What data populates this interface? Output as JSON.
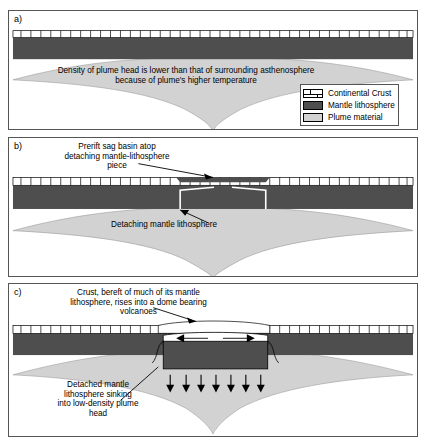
{
  "figure": {
    "type": "geologic-cross-section-diagram",
    "panels": [
      {
        "id": "a",
        "label": "a)",
        "annotations": [
          {
            "name": "plume-density-note",
            "text": "Density of plume head is lower than that of surrounding asthenosphere\nbecause of plume's higher temperature"
          }
        ]
      },
      {
        "id": "b",
        "label": "b)",
        "annotations": [
          {
            "name": "prerift-sag-basin-note",
            "text": "Prerift sag basin atop\ndetaching mantle-lithosphere\npiece"
          },
          {
            "name": "detaching-mantle-lithosphere-note",
            "text": "Detaching mantle lithosphere"
          }
        ]
      },
      {
        "id": "c",
        "label": "c)",
        "annotations": [
          {
            "name": "crust-dome-note",
            "text": "Crust, bereft of much of its mantle\nlithosphere, rises into a dome bearing\nvolcanoes"
          },
          {
            "name": "detached-sinking-note",
            "text": "Detached mantle\nlithosphere sinking\ninto low-density plume\nhead"
          }
        ]
      }
    ]
  },
  "legend": {
    "items": [
      {
        "label": "Continental Crust",
        "swatch": "crust",
        "color": "#ffffff"
      },
      {
        "label": "Mantle lithosphere",
        "swatch": "mantle",
        "color": "#4e4e4e"
      },
      {
        "label": "Plume material",
        "swatch": "plume",
        "color": "#d2d2d2"
      }
    ]
  },
  "colors": {
    "crust": "#ffffff",
    "mantle_lithosphere": "#4e4e4e",
    "plume_material": "#d2d2d2",
    "outline": "#555555",
    "ink": "#000000"
  }
}
